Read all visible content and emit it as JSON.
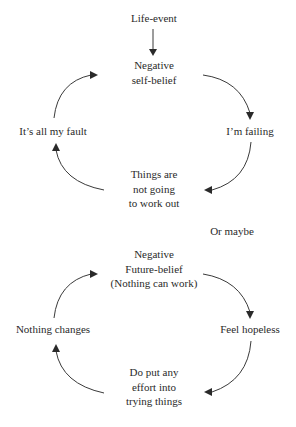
{
  "diagram_1": {
    "trigger": "Life-event",
    "nodes": {
      "top": [
        "Negative",
        "self-belief"
      ],
      "right": "I’m failing",
      "bottom": [
        "Things are",
        "not going",
        "to work out"
      ],
      "left": "It’s all my fault"
    }
  },
  "separator": "Or maybe",
  "diagram_2": {
    "nodes": {
      "top": [
        "Negative",
        "Future-belief",
        "(Nothing can work)"
      ],
      "right": "Feel hopeless",
      "bottom": [
        "Do put any",
        "effort into",
        "trying things"
      ],
      "left": "Nothing changes"
    }
  },
  "style": {
    "stroke_color": "#3a3a3a",
    "text_color": "#2a2a2a",
    "background": "#ffffff"
  }
}
